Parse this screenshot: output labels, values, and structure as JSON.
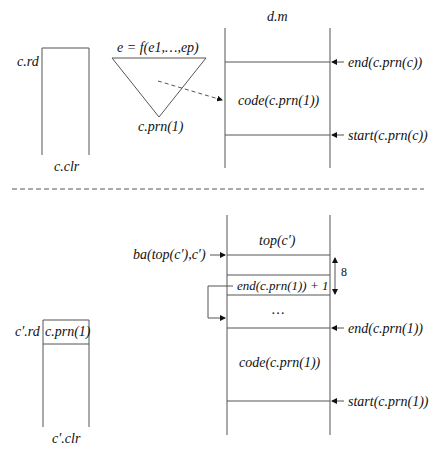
{
  "top_panel": {
    "register_label": "c.rd",
    "register_bottom_label": "c.clr",
    "tree_label": "e = f(e1,…,ep)",
    "tree_bottom_label": "c.prn(1)",
    "memory_title": "d.m",
    "memory_code_label": "code(c.prn(1))",
    "end_marker": "end(c.prn(c))",
    "start_marker": "start(c.prn(c))"
  },
  "bottom_panel": {
    "register_label": "c′.rd",
    "register_cell": "c.prn(1)",
    "register_bottom_label": "c′.clr",
    "ba_label": "ba(top(c′),c′)",
    "top_label": "top(c′)",
    "end_plus_one_label": "end(c.prn(1)) + 1",
    "gap_size": "8",
    "ellipsis": "…",
    "end_marker": "end(c.prn(1))",
    "code_label": "code(c.prn(1))",
    "start_marker": "start(c.prn(1))"
  }
}
